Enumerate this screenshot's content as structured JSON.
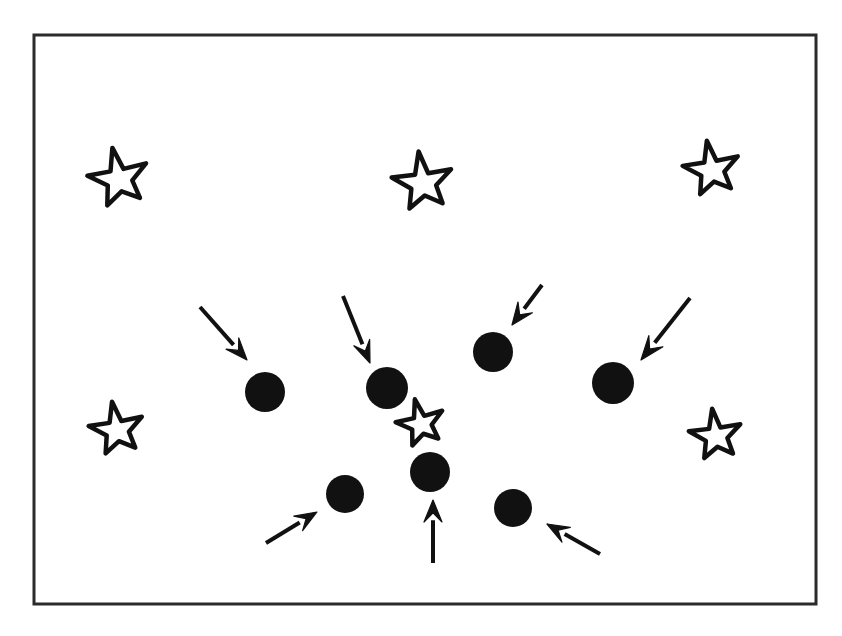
{
  "figure": {
    "caption": "",
    "background_color": "#ffffff",
    "ink_color": "#111111",
    "canvas": {
      "width": 842,
      "height": 636
    },
    "frame": {
      "label": "field-of-view border",
      "x": 34,
      "y": 35,
      "width": 782,
      "height": 569,
      "stroke_width": 3,
      "stroke_color": "#2b2b2b",
      "fill_color": "#ffffff"
    },
    "legend_note": "Arrows indicate the filled circular objects; open stars are unlabelled features.",
    "counts": {
      "stars": 6,
      "circles": 7,
      "arrows": 7
    },
    "stars": [
      {
        "name": "star-top-left",
        "cx": 119,
        "cy": 179,
        "r": 30,
        "rotation": -12,
        "stroke_width": 4.5
      },
      {
        "name": "star-top-center",
        "cx": 423,
        "cy": 183,
        "r": 30,
        "rotation": -8,
        "stroke_width": 4.5
      },
      {
        "name": "star-top-right",
        "cx": 712,
        "cy": 170,
        "r": 28,
        "rotation": -10,
        "stroke_width": 4.5
      },
      {
        "name": "star-middle-left",
        "cx": 117,
        "cy": 430,
        "r": 27,
        "rotation": -10,
        "stroke_width": 4.5
      },
      {
        "name": "star-center",
        "cx": 421,
        "cy": 424,
        "r": 24,
        "rotation": -14,
        "stroke_width": 4.5
      },
      {
        "name": "star-middle-right",
        "cx": 716,
        "cy": 436,
        "r": 26,
        "rotation": -8,
        "stroke_width": 4.5
      }
    ],
    "circles": [
      {
        "name": "circle-1",
        "cx": 265,
        "cy": 392,
        "r": 20
      },
      {
        "name": "circle-2",
        "cx": 387,
        "cy": 388,
        "r": 21
      },
      {
        "name": "circle-3",
        "cx": 493,
        "cy": 352,
        "r": 20
      },
      {
        "name": "circle-4",
        "cx": 613,
        "cy": 383,
        "r": 21
      },
      {
        "name": "circle-5",
        "cx": 345,
        "cy": 494,
        "r": 19
      },
      {
        "name": "circle-6",
        "cx": 430,
        "cy": 472,
        "r": 20
      },
      {
        "name": "circle-7",
        "cx": 513,
        "cy": 508,
        "r": 19
      }
    ],
    "arrows": [
      {
        "name": "arrow-1",
        "x1": 200,
        "y1": 307,
        "x2": 247,
        "y2": 360,
        "target": "circle-1",
        "shaft_width": 4,
        "head_length": 22,
        "head_width": 17
      },
      {
        "name": "arrow-2",
        "x1": 343,
        "y1": 296,
        "x2": 370,
        "y2": 363,
        "target": "circle-2",
        "shaft_width": 4,
        "head_length": 22,
        "head_width": 17
      },
      {
        "name": "arrow-3",
        "x1": 542,
        "y1": 285,
        "x2": 512,
        "y2": 325,
        "target": "circle-3",
        "shaft_width": 4,
        "head_length": 22,
        "head_width": 18
      },
      {
        "name": "arrow-4",
        "x1": 690,
        "y1": 298,
        "x2": 641,
        "y2": 360,
        "target": "circle-4",
        "shaft_width": 4,
        "head_length": 24,
        "head_width": 18
      },
      {
        "name": "arrow-5",
        "x1": 266,
        "y1": 543,
        "x2": 317,
        "y2": 512,
        "target": "circle-5",
        "shaft_width": 4,
        "head_length": 22,
        "head_width": 17
      },
      {
        "name": "arrow-6",
        "x1": 433,
        "y1": 563,
        "x2": 433,
        "y2": 500,
        "target": "circle-6",
        "shaft_width": 4,
        "head_length": 22,
        "head_width": 18
      },
      {
        "name": "arrow-7",
        "x1": 600,
        "y1": 554,
        "x2": 547,
        "y2": 524,
        "target": "circle-7",
        "shaft_width": 4,
        "head_length": 22,
        "head_width": 17
      }
    ]
  }
}
